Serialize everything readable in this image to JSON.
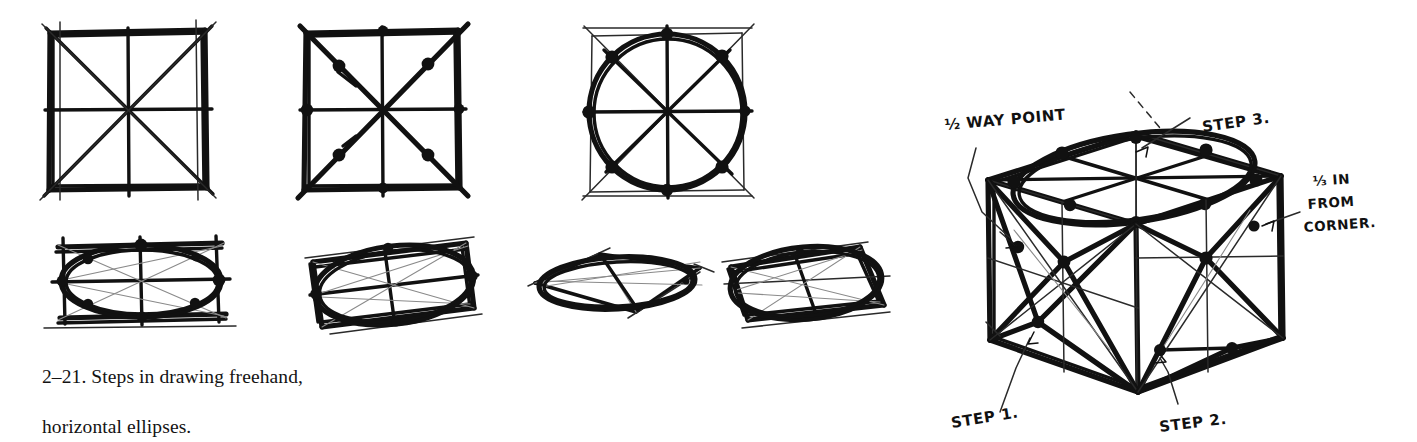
{
  "figure": {
    "id": "2-21",
    "caption_line1": "2–21. Steps in drawing freehand,",
    "caption_line2": "horizontal ellipses.",
    "caption_full": "2–21. Steps in drawing freehand, horizontal ellipses.",
    "medium": "pen-and-ink freehand sketch",
    "ink_color": "#111111",
    "paper_color": "#ffffff"
  },
  "top_row": {
    "label": "steps-in-square",
    "steps": [
      {
        "index": 1,
        "name": "square-with-center-lines-and-diagonals",
        "description": "Freehand square with vertical and horizontal center lines and both corner-to-corner diagonals.",
        "point_count": 0
      },
      {
        "index": 2,
        "name": "eight-construction-points",
        "description": "Same square with eight heavy points marked: four at the mid-points of the sides and four on the diagonals one third in from each corner.",
        "point_count": 8
      },
      {
        "index": 3,
        "name": "circle-through-points",
        "description": "Circle drawn freehand through the eight construction points.",
        "point_count": 8
      }
    ]
  },
  "bottom_row": {
    "label": "ellipses-in-perspective-squares",
    "steps": [
      {
        "index": 1,
        "name": "flat-horizontal-ellipse",
        "description": "Wide shallow rectangle with an inscribed flat ellipse and construction points."
      },
      {
        "index": 2,
        "name": "tilted-parallelogram-ellipse",
        "description": "Tilted perspective square with an inscribed ellipse."
      },
      {
        "index": 3,
        "name": "narrow-rhombus-ellipse",
        "description": "Very narrow rhombus with an extremely flat inscribed ellipse."
      },
      {
        "index": 4,
        "name": "angled-perspective-ellipse",
        "description": "Angled perspective square with an inscribed ellipse and diagonals."
      }
    ]
  },
  "cube_diagram": {
    "name": "isometric-cube-with-inscribed-ellipses",
    "description": "Freehand isometric cube showing the eight-point construction applied to the top and the two visible side faces, with an ellipse drawn on the top face.",
    "annotations": [
      {
        "key": "half-way-point",
        "text": "½ WAY POINT"
      },
      {
        "key": "step-3",
        "text": "STEP 3."
      },
      {
        "key": "third-in-from-corner-line1",
        "text": "⅓ IN"
      },
      {
        "key": "third-in-from-corner-line2",
        "text": "FROM"
      },
      {
        "key": "third-in-from-corner-line3",
        "text": "CORNER."
      },
      {
        "key": "step-1",
        "text": "STEP 1."
      },
      {
        "key": "step-2",
        "text": "STEP 2."
      }
    ]
  }
}
